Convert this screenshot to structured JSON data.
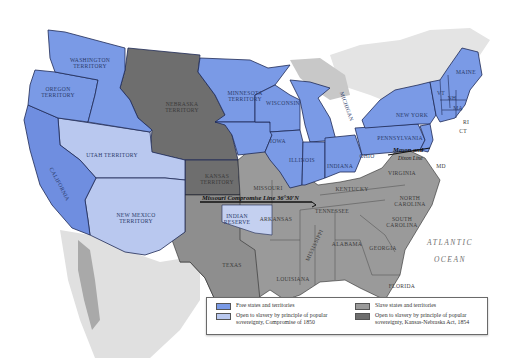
{
  "map": {
    "title": "",
    "colors": {
      "free": "#7a9ae6",
      "popular_sovereignty_1850": "#b9c8ef",
      "slave": "#9a9a9a",
      "kansas_nebraska_1854": "#6e6e6e",
      "foreign_land": "#d6d6d6",
      "water": "#ffffff",
      "border": "#1e2a55"
    },
    "labels": {
      "washington": "WASHINGTON",
      "washington2": "TERRITORY",
      "oregon": "OREGON",
      "oregon2": "TERRITORY",
      "california": "CALIFORNIA",
      "utah": "UTAH TERRITORY",
      "new_mexico": "NEW MEXICO",
      "new_mexico2": "TERRITORY",
      "nebraska": "NEBRASKA",
      "nebraska2": "TERRITORY",
      "kansas": "KANSAS",
      "kansas2": "TERRITORY",
      "minnesota": "MINNESOTA",
      "minnesota2": "TERRITORY",
      "wisconsin": "WISCONSIN",
      "michigan": "MICHIGAN",
      "iowa": "IOWA",
      "illinois": "ILLINOIS",
      "indiana": "INDIANA",
      "ohio": "OHIO",
      "pennsylvania": "PENNSYLVANIA",
      "new_york": "NEW YORK",
      "maine": "MAINE",
      "vt": "VT",
      "nh": "NH",
      "ma": "MA",
      "ri": "RI",
      "ct": "CT",
      "nj": "NJ",
      "de": "DE",
      "md": "MD",
      "missouri": "MISSOURI",
      "kentucky": "KENTUCKY",
      "virginia": "VIRGINIA",
      "north_carolina": "NORTH",
      "north_carolina2": "CAROLINA",
      "south_carolina": "SOUTH",
      "south_carolina2": "CAROLINA",
      "tennessee": "TENNESSEE",
      "arkansas": "ARKANSAS",
      "indian_reserve": "INDIAN",
      "indian_reserve2": "RESERVE",
      "texas": "TEXAS",
      "louisiana": "LOUISIANA",
      "mississippi": "MISSISSIPPI",
      "alabama": "ALABAMA",
      "georgia": "GEORGIA",
      "florida": "FLORIDA",
      "atlantic": "ATLANTIC",
      "ocean": "OCEAN"
    },
    "lines": {
      "missouri_compromise": "Missouri Compromise Line 36°30′N",
      "mason_dixon_1": "Mason and",
      "mason_dixon_2": "Dixon Line"
    }
  },
  "legend": {
    "items": [
      {
        "label": "Free states and territories",
        "color": "#7a9ae6"
      },
      {
        "label": "Open to slavery by principle of popular sovereignty, Compromise of 1850",
        "color": "#b9c8ef"
      },
      {
        "label": "Slave states and territories",
        "color": "#9a9a9a"
      },
      {
        "label": "Open to slavery by principle of popular sovereignty, Kansas-Nebraska Act, 1854",
        "color": "#6e6e6e"
      }
    ]
  }
}
